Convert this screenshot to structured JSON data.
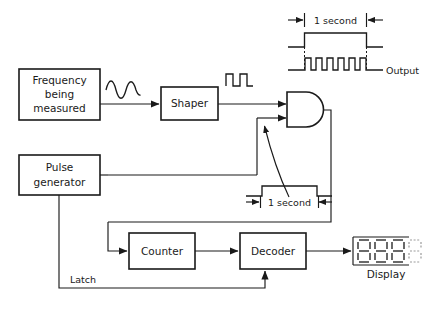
{
  "diagram": {
    "blocks": [
      {
        "id": "frequency",
        "label_line1": "Frequency",
        "label_line2": "being",
        "label_line3": "measured"
      },
      {
        "id": "shaper",
        "label": "Shaper"
      },
      {
        "id": "pulse_generator",
        "label_line1": "Pulse",
        "label_line2": "generator"
      },
      {
        "id": "counter",
        "label": "Counter"
      },
      {
        "id": "decoder",
        "label": "Decoder"
      },
      {
        "id": "display",
        "label": "Display",
        "digits": "8888"
      }
    ],
    "gate": {
      "id": "and-gate",
      "type": "AND"
    },
    "annotations": [
      {
        "id": "gate-window-top",
        "text": "1 second"
      },
      {
        "id": "gate-window-mid",
        "text": "1 second"
      },
      {
        "id": "output-label",
        "text": "Output"
      },
      {
        "id": "latch-label",
        "text": "Latch"
      }
    ],
    "waveforms": [
      {
        "id": "sine-input",
        "type": "sine",
        "cycles": 2
      },
      {
        "id": "shaper-output",
        "type": "square",
        "pulses": 2
      },
      {
        "id": "timing-gate",
        "type": "gate",
        "pulses": 1
      },
      {
        "id": "timing-output",
        "type": "square",
        "pulses": 6
      }
    ],
    "colors": {
      "ink": "#1a1a1a",
      "paper": "#ffffff",
      "faint": "#9b9b9b"
    }
  }
}
